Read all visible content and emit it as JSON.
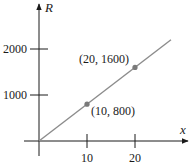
{
  "chart_data": {
    "type": "line",
    "title": "",
    "xlabel": "x",
    "ylabel": "R",
    "xlim": [
      0,
      28
    ],
    "ylim": [
      0,
      2800
    ],
    "x_ticks": [
      10,
      20
    ],
    "y_ticks": [
      1000,
      2000
    ],
    "x_tick_labels": [
      "10",
      "20"
    ],
    "y_tick_labels": [
      "1000",
      "2000"
    ],
    "grid": false,
    "legend": null,
    "series": [
      {
        "name": "R = 80x",
        "x": [
          0,
          27.5
        ],
        "y": [
          0,
          2200
        ],
        "color": "#8c8c8c"
      }
    ],
    "points": [
      {
        "x": 10,
        "y": 800,
        "label": "(10, 800)",
        "label_position": "below-right"
      },
      {
        "x": 20,
        "y": 1600,
        "label": "(20, 1600)",
        "label_position": "above-left"
      }
    ]
  },
  "colors": {
    "axis": "#1a1a1a",
    "line": "#8c8c8c",
    "point": "#7a7a7a",
    "text": "#1a1a1a"
  }
}
